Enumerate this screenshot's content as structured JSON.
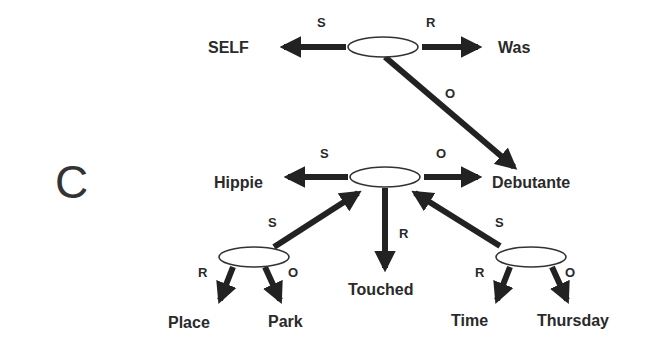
{
  "figure": {
    "panel_letter": "C",
    "colors": {
      "ink": "#222222",
      "background": "#ffffff"
    }
  },
  "nodes": {
    "self": "SELF",
    "was": "Was",
    "hippie": "Hippie",
    "debutante": "Debutante",
    "touched": "Touched",
    "place": "Place",
    "park": "Park",
    "time": "Time",
    "thursday": "Thursday"
  },
  "edges": {
    "top_s": "S",
    "top_r": "R",
    "top_o": "O",
    "mid_s": "S",
    "mid_o": "O",
    "mid_r": "R",
    "left_s": "S",
    "left_r": "R",
    "left_o": "O",
    "right_s": "S",
    "right_r": "R",
    "right_o": "O"
  }
}
